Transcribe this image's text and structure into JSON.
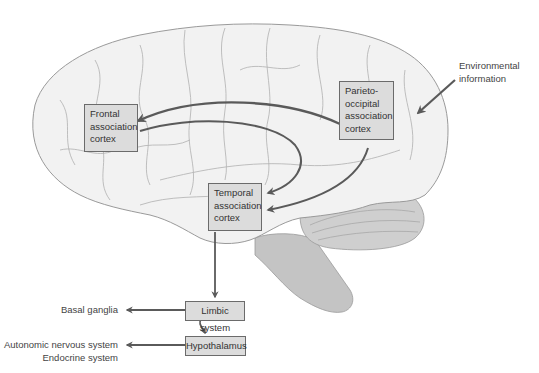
{
  "diagram": {
    "boxes": {
      "frontal": [
        "Frontal",
        "association",
        "cortex"
      ],
      "parieto_occipital": [
        "Parieto-",
        "occipital",
        "association",
        "cortex"
      ],
      "temporal": [
        "Temporal",
        "association",
        "cortex"
      ],
      "limbic": "Limbic system",
      "hypothalamus": "Hypothalamus"
    },
    "external_labels": {
      "environmental": [
        "Environmental",
        "information"
      ],
      "basal_ganglia": "Basal ganglia",
      "autonomic": [
        "Autonomic nervous system",
        "Endocrine system"
      ]
    },
    "arrows": [
      {
        "from": "Environmental information",
        "to": "Parieto-occipital association cortex"
      },
      {
        "from": "Parieto-occipital association cortex",
        "to": "Frontal association cortex"
      },
      {
        "from": "Frontal association cortex",
        "to": "Temporal association cortex"
      },
      {
        "from": "Parieto-occipital association cortex",
        "to": "Temporal association cortex"
      },
      {
        "from": "Temporal association cortex",
        "to": "Limbic system"
      },
      {
        "from": "Limbic system",
        "to": "Basal ganglia"
      },
      {
        "from": "Limbic system",
        "to": "Hypothalamus"
      },
      {
        "from": "Hypothalamus",
        "to": "Autonomic nervous system / Endocrine system"
      }
    ],
    "colors": {
      "box_fill": "#dcdcdc",
      "box_border": "#6b6b6b",
      "arrow": "#5a5a5a",
      "brain_fill": "#f2f2f2",
      "brain_outline": "#9a9a9a",
      "brainstem_fill": "#c4c4c4",
      "cerebellum_fill": "#cfcfcf"
    }
  }
}
